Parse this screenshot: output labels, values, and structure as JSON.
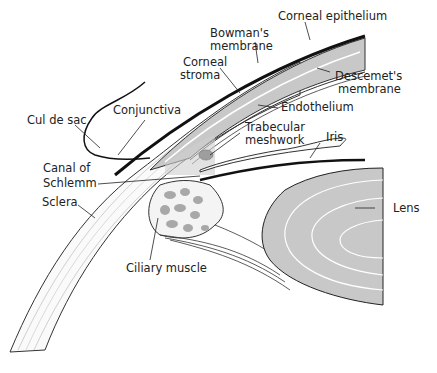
{
  "diagram": {
    "labels": {
      "corneal_epithelium": "Corneal epithelium",
      "bowmans_membrane_1": "Bowman's",
      "bowmans_membrane_2": "membrane",
      "corneal_stroma_1": "Corneal",
      "corneal_stroma_2": "stroma",
      "descemets_membrane_1": "Descemet's",
      "descemets_membrane_2": "membrane",
      "endothelium": "Endothelium",
      "cul_de_sac": "Cul de sac",
      "conjunctiva": "Conjunctiva",
      "trabecular_meshwork_1": "Trabecular",
      "trabecular_meshwork_2": "meshwork",
      "iris": "Iris",
      "canal_of_schlemm_1": "Canal of",
      "canal_of_schlemm_2": "Schlemm",
      "sclera": "Sclera",
      "lens": "Lens",
      "ciliary_muscle": "Ciliary muscle"
    },
    "colors": {
      "tissue_gray": "#c8c8c8",
      "outline": "#222222",
      "background": "#ffffff"
    }
  }
}
